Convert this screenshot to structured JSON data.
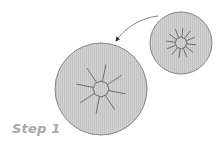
{
  "diagram": {
    "label": "Step 1",
    "colors": {
      "fill": "#cfcfcf",
      "stroke": "#6f6f6f",
      "ray": "#555555",
      "arrow": "#555555",
      "label": "#a8a8a8"
    },
    "small_cell": {
      "cx": 181,
      "cy": 43,
      "r": 31,
      "nucleus_r": 6,
      "ray_len": 15,
      "rays": 12
    },
    "large_cell": {
      "cx": 101,
      "cy": 89,
      "r": 46,
      "nucleus_r": 8,
      "ray_len": 25,
      "rays": 8
    },
    "arrow": {
      "from": "small_cell",
      "to": "large_cell"
    }
  }
}
